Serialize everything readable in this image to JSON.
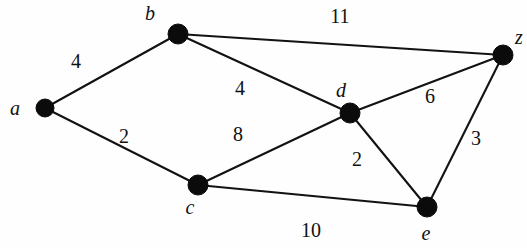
{
  "figure": {
    "kind": "weighted-undirected-graph",
    "width": 527,
    "height": 248,
    "background_color": "#fefefe",
    "ink_color": "#111111"
  },
  "chart_data": {
    "type": "diagram",
    "title": "",
    "xlabel": "",
    "ylabel": "",
    "grid": false,
    "legend": false,
    "graph_type": "weighted undirected graph",
    "nodes": [
      {
        "id": "a",
        "label": "a",
        "x": 45,
        "y": 108,
        "r": 9,
        "label_x": 15,
        "label_y": 115
      },
      {
        "id": "b",
        "label": "b",
        "x": 178,
        "y": 34,
        "r": 10,
        "label_x": 150,
        "label_y": 20
      },
      {
        "id": "c",
        "label": "c",
        "x": 198,
        "y": 185,
        "r": 10,
        "label_x": 190,
        "label_y": 214
      },
      {
        "id": "d",
        "label": "d",
        "x": 350,
        "y": 113,
        "r": 10,
        "label_x": 341,
        "label_y": 97
      },
      {
        "id": "e",
        "label": "e",
        "x": 427,
        "y": 207,
        "r": 10,
        "label_x": 426,
        "label_y": 240
      },
      {
        "id": "z",
        "label": "z",
        "x": 503,
        "y": 55,
        "r": 10,
        "label_x": 519,
        "label_y": 44
      }
    ],
    "edges": [
      {
        "source": "a",
        "target": "b",
        "weight": 4,
        "label": "4",
        "label_x": 76,
        "label_y": 68
      },
      {
        "source": "a",
        "target": "c",
        "weight": 2,
        "label": "2",
        "label_x": 124,
        "label_y": 143
      },
      {
        "source": "b",
        "target": "d",
        "weight": 4,
        "label": "4",
        "label_x": 240,
        "label_y": 95
      },
      {
        "source": "b",
        "target": "z",
        "weight": 11,
        "label": "11",
        "label_x": 340,
        "label_y": 23
      },
      {
        "source": "c",
        "target": "d",
        "weight": 8,
        "label": "8",
        "label_x": 238,
        "label_y": 141
      },
      {
        "source": "c",
        "target": "e",
        "weight": 10,
        "label": "10",
        "label_x": 311,
        "label_y": 237
      },
      {
        "source": "d",
        "target": "e",
        "weight": 2,
        "label": "2",
        "label_x": 357,
        "label_y": 166
      },
      {
        "source": "d",
        "target": "z",
        "weight": 6,
        "label": "6",
        "label_x": 430,
        "label_y": 103
      },
      {
        "source": "e",
        "target": "z",
        "weight": 3,
        "label": "3",
        "label_x": 476,
        "label_y": 145
      }
    ],
    "node_labels": [
      "a",
      "b",
      "c",
      "d",
      "e",
      "z"
    ],
    "edge_weights": [
      4,
      2,
      4,
      11,
      8,
      10,
      2,
      6,
      3
    ]
  }
}
